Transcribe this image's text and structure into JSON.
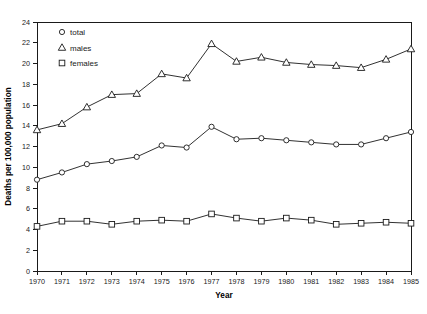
{
  "chart_data": {
    "type": "line",
    "title": "",
    "xlabel": "Year",
    "ylabel": "Deaths per 100,000 population",
    "x": [
      1970,
      1971,
      1972,
      1973,
      1974,
      1975,
      1976,
      1977,
      1978,
      1979,
      1980,
      1981,
      1982,
      1983,
      1984,
      1985
    ],
    "categories": [
      "1970",
      "1971",
      "1972",
      "1973",
      "1974",
      "1975",
      "1976",
      "1977",
      "1978",
      "1979",
      "1980",
      "1981",
      "1982",
      "1983",
      "1984",
      "1985"
    ],
    "xlim": [
      1970,
      1985
    ],
    "ylim": [
      0,
      24
    ],
    "yticks": [
      0,
      2,
      4,
      6,
      8,
      10,
      12,
      14,
      16,
      18,
      20,
      22,
      24
    ],
    "ytick_labels": [
      "0",
      "2",
      "4",
      "6",
      "8",
      "10",
      "12",
      "14",
      "16",
      "18",
      "20",
      "22",
      "24"
    ],
    "grid": false,
    "legend_position": "top-left",
    "series": [
      {
        "name": "total",
        "marker": "circle",
        "color": "#1a1a1a",
        "values": [
          8.8,
          9.5,
          10.3,
          10.6,
          11.0,
          12.1,
          11.9,
          13.9,
          12.7,
          12.8,
          12.6,
          12.4,
          12.2,
          12.2,
          12.8,
          13.4
        ]
      },
      {
        "name": "males",
        "marker": "triangle",
        "color": "#1a1a1a",
        "values": [
          13.6,
          14.2,
          15.8,
          17.0,
          17.1,
          19.0,
          18.6,
          21.9,
          20.2,
          20.6,
          20.1,
          19.9,
          19.8,
          19.6,
          20.4,
          21.4
        ]
      },
      {
        "name": "females",
        "marker": "square",
        "color": "#1a1a1a",
        "values": [
          4.3,
          4.8,
          4.8,
          4.5,
          4.8,
          4.9,
          4.8,
          5.5,
          5.1,
          4.8,
          5.1,
          4.9,
          4.5,
          4.6,
          4.7,
          4.6
        ]
      }
    ],
    "legend": [
      {
        "label": "total",
        "marker": "circle"
      },
      {
        "label": "males",
        "marker": "triangle"
      },
      {
        "label": "females",
        "marker": "square"
      }
    ]
  }
}
